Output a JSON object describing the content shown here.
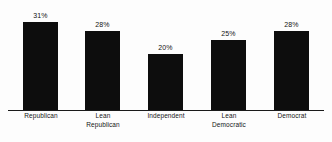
{
  "chart_data": {
    "type": "bar",
    "title": "",
    "subtitle": "",
    "xlabel": "",
    "ylabel": "",
    "ylim": [
      0,
      35
    ],
    "grid": false,
    "legend": false,
    "orientation": "vertical",
    "bar_color": "#0d0d0d",
    "background_color": "#fdfdfd",
    "categories": [
      "Republican",
      "Lean Republican",
      "Independent",
      "Lean Democratic",
      "Democrat"
    ],
    "category_lines": [
      [
        "Republican"
      ],
      [
        "Lean",
        "Republican"
      ],
      [
        "Independent"
      ],
      [
        "Lean",
        "Democratic"
      ],
      [
        "Democrat"
      ]
    ],
    "values": [
      31,
      28,
      20,
      25,
      28
    ],
    "data_labels": [
      "31%",
      "28%",
      "20%",
      "25%",
      "28%"
    ]
  }
}
